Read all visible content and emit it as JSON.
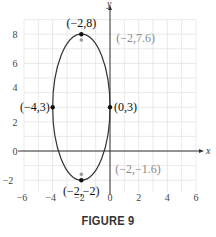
{
  "caption": "FIGURE 9",
  "chart_data": {
    "type": "line",
    "title": "",
    "xlabel": "x",
    "ylabel": "y",
    "xlim": [
      -6,
      6
    ],
    "ylim": [
      -2.8,
      9
    ],
    "grid": true,
    "x_ticks": [
      "−6",
      "−4",
      "−2",
      "0",
      "2",
      "4",
      "6"
    ],
    "x_tick_values": [
      -6,
      -4,
      -2,
      0,
      2,
      4,
      6
    ],
    "y_ticks": [
      "8",
      "6",
      "4",
      "2",
      "0",
      "−2"
    ],
    "y_tick_values": [
      8,
      6,
      4,
      2,
      0,
      -2
    ],
    "series": [
      {
        "name": "ellipse",
        "shape": "ellipse",
        "center": [
          -2,
          3
        ],
        "semi_axis_x": 2,
        "semi_axis_y": 5,
        "color": "#333333"
      }
    ],
    "points": [
      {
        "x": -2,
        "y": 8,
        "label": "(−2,8)",
        "style": "black"
      },
      {
        "x": -4,
        "y": 3,
        "label": "(−4,3)",
        "style": "black"
      },
      {
        "x": 0,
        "y": 3,
        "label": "(0,3)",
        "style": "black"
      },
      {
        "x": -2,
        "y": -2,
        "label": "(−2,−2)",
        "style": "black"
      },
      {
        "x": -2,
        "y": 7.6,
        "label": "(−2,7.6)",
        "style": "gray"
      },
      {
        "x": -2,
        "y": -1.6,
        "label": "(−2,−1.6)",
        "style": "gray"
      }
    ],
    "colors": {
      "curve": "#333333",
      "grid": "#e3e3e3",
      "focus": "#999999",
      "focus_label": "#8a8a8a"
    }
  }
}
